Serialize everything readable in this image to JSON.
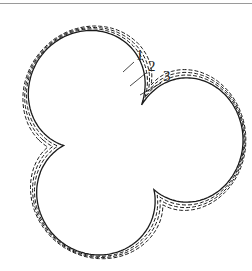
{
  "diagram": {
    "type": "three-lobed contour profiles",
    "center": [
      125,
      140
    ],
    "rotation_deg": 0,
    "curves": [
      {
        "id": "1",
        "label": "1",
        "style": "solid",
        "scale": 1.0,
        "inner_offset": 0
      },
      {
        "id": "2",
        "label": "2",
        "style": "dashed",
        "scale": 1.0,
        "inner_offset": 7
      },
      {
        "id": "3",
        "label": "3",
        "style": "dashed",
        "scale": 1.0,
        "inner_offset": 13
      },
      {
        "id": "4",
        "label": "",
        "style": "dashed",
        "scale": 1.0,
        "inner_offset": 19
      }
    ],
    "labels": [
      {
        "text": "1",
        "x": 136,
        "y": 60,
        "leader_to": [
          123,
          72
        ]
      },
      {
        "text": "2",
        "x": 148,
        "y": 71,
        "leader_to": [
          130,
          86
        ]
      },
      {
        "text": "3",
        "x": 163,
        "y": 81,
        "leader_to": [
          140,
          95
        ]
      }
    ],
    "stroke_color": "#1a1a1a",
    "top_rule_color": "#9a9a9a"
  }
}
